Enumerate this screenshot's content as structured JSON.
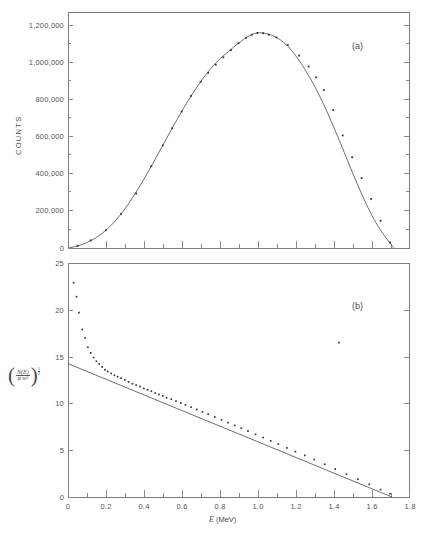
{
  "figure": {
    "panel_a_tag": "(a)",
    "panel_b_tag": "(b)"
  },
  "panel_a": {
    "ylabel": "COUNTS",
    "ytick_labels": [
      "0",
      "200,000",
      "400,000",
      "600,000",
      "800,000",
      "1,000,000",
      "1,200,000"
    ]
  },
  "panel_b": {
    "ylabel_numerator": "N(E)",
    "ylabel_denominator": "φ w²",
    "ylabel_exponent_num": "1",
    "ylabel_exponent_den": "2",
    "ytick_labels": [
      "0",
      "5",
      "10",
      "15",
      "20",
      "25"
    ],
    "xtick_labels": [
      "0",
      "0.2",
      "0.4",
      "0.6",
      "0.8",
      "1.0",
      "1.2",
      "1.4",
      "1.6",
      "1.8"
    ],
    "xlabel_symbol": "E",
    "xlabel_units": "(MeV)"
  },
  "chart_data": [
    {
      "type": "line",
      "panel": "(a)",
      "title": "",
      "xlabel": "E (MeV)",
      "ylabel": "COUNTS",
      "xlim": [
        0,
        1.8
      ],
      "ylim": [
        0,
        1300000
      ],
      "ytick_values": [
        0,
        200000,
        400000,
        600000,
        800000,
        1000000,
        1200000
      ],
      "xtick_values": [
        0,
        0.2,
        0.4,
        0.6,
        0.8,
        1.0,
        1.2,
        1.4,
        1.6,
        1.8
      ],
      "grid": false,
      "legend": "none",
      "series": [
        {
          "name": "beta spectrum (fitted curve)",
          "x": [
            0.0,
            0.05,
            0.1,
            0.15,
            0.2,
            0.25,
            0.3,
            0.35,
            0.4,
            0.45,
            0.5,
            0.55,
            0.6,
            0.65,
            0.7,
            0.75,
            0.8,
            0.85,
            0.9,
            0.95,
            1.0,
            1.05,
            1.1,
            1.15,
            1.2,
            1.25,
            1.3,
            1.35,
            1.4,
            1.45,
            1.5,
            1.55,
            1.6,
            1.65,
            1.7,
            1.72
          ],
          "values": [
            0,
            11000,
            30000,
            58000,
            98000,
            150000,
            215000,
            292000,
            378000,
            470000,
            565000,
            660000,
            752000,
            838000,
            916000,
            984000,
            1040000,
            1085000,
            1128000,
            1165000,
            1185000,
            1180000,
            1160000,
            1122000,
            1062000,
            985000,
            895000,
            790000,
            672000,
            548000,
            420000,
            298000,
            188000,
            98000,
            26000,
            0
          ]
        },
        {
          "name": "measured points",
          "x": [
            0.05,
            0.12,
            0.2,
            0.28,
            0.36,
            0.44,
            0.5,
            0.55,
            0.6,
            0.65,
            0.7,
            0.74,
            0.78,
            0.82,
            0.86,
            0.9,
            0.94,
            0.97,
            1.0,
            1.03,
            1.06,
            1.1,
            1.16,
            1.22,
            1.27,
            1.31,
            1.35,
            1.4,
            1.45,
            1.5,
            1.55,
            1.6,
            1.65,
            1.7
          ],
          "values": [
            12000,
            42000,
            98000,
            188000,
            300000,
            450000,
            565000,
            660000,
            752000,
            838000,
            916000,
            965000,
            1010000,
            1050000,
            1090000,
            1128000,
            1158000,
            1175000,
            1185000,
            1183000,
            1175000,
            1160000,
            1118000,
            1060000,
            1000000,
            940000,
            870000,
            760000,
            620000,
            500000,
            385000,
            270000,
            150000,
            30000
          ]
        }
      ]
    },
    {
      "type": "scatter",
      "panel": "(b)",
      "title": "",
      "xlabel": "E (MeV)",
      "ylabel": "(N(E)/φw²)^(1/2)",
      "xlim": [
        0,
        1.8
      ],
      "ylim": [
        0,
        25
      ],
      "ytick_values": [
        0,
        5,
        10,
        15,
        20,
        25
      ],
      "xtick_values": [
        0,
        0.2,
        0.4,
        0.6,
        0.8,
        1.0,
        1.2,
        1.4,
        1.6,
        1.8
      ],
      "grid": false,
      "legend": "none",
      "series": [
        {
          "name": "Kurie plot points",
          "x": [
            0.03,
            0.045,
            0.058,
            0.075,
            0.09,
            0.105,
            0.12,
            0.135,
            0.15,
            0.165,
            0.18,
            0.195,
            0.21,
            0.228,
            0.245,
            0.262,
            0.28,
            0.3,
            0.32,
            0.34,
            0.36,
            0.38,
            0.4,
            0.42,
            0.44,
            0.46,
            0.48,
            0.5,
            0.52,
            0.545,
            0.57,
            0.595,
            0.62,
            0.65,
            0.68,
            0.71,
            0.74,
            0.775,
            0.81,
            0.845,
            0.88,
            0.915,
            0.95,
            0.99,
            1.03,
            1.07,
            1.11,
            1.155,
            1.2,
            1.25,
            1.3,
            1.355,
            1.41,
            1.47,
            1.53,
            1.59,
            1.65,
            1.7,
            1.43
          ],
          "values": [
            22.9,
            21.4,
            19.7,
            17.9,
            17.0,
            16.0,
            15.4,
            14.9,
            14.5,
            14.2,
            13.9,
            13.6,
            13.4,
            13.2,
            13.0,
            12.85,
            12.7,
            12.5,
            12.3,
            12.1,
            11.95,
            11.8,
            11.6,
            11.45,
            11.3,
            11.1,
            10.95,
            10.8,
            10.6,
            10.45,
            10.25,
            10.05,
            9.85,
            9.6,
            9.35,
            9.1,
            8.85,
            8.55,
            8.25,
            7.95,
            7.65,
            7.35,
            7.05,
            6.7,
            6.35,
            6.0,
            5.65,
            5.25,
            4.85,
            4.45,
            4.0,
            3.5,
            3.0,
            2.45,
            1.9,
            1.35,
            0.8,
            0.35,
            16.5
          ]
        },
        {
          "name": "linear fit",
          "x": [
            0.0,
            1.71
          ],
          "values": [
            14.25,
            0.0
          ]
        }
      ],
      "annotations": [
        {
          "text": "endpoint energy intercept",
          "x": 1.71,
          "y": 0.0
        }
      ]
    }
  ]
}
